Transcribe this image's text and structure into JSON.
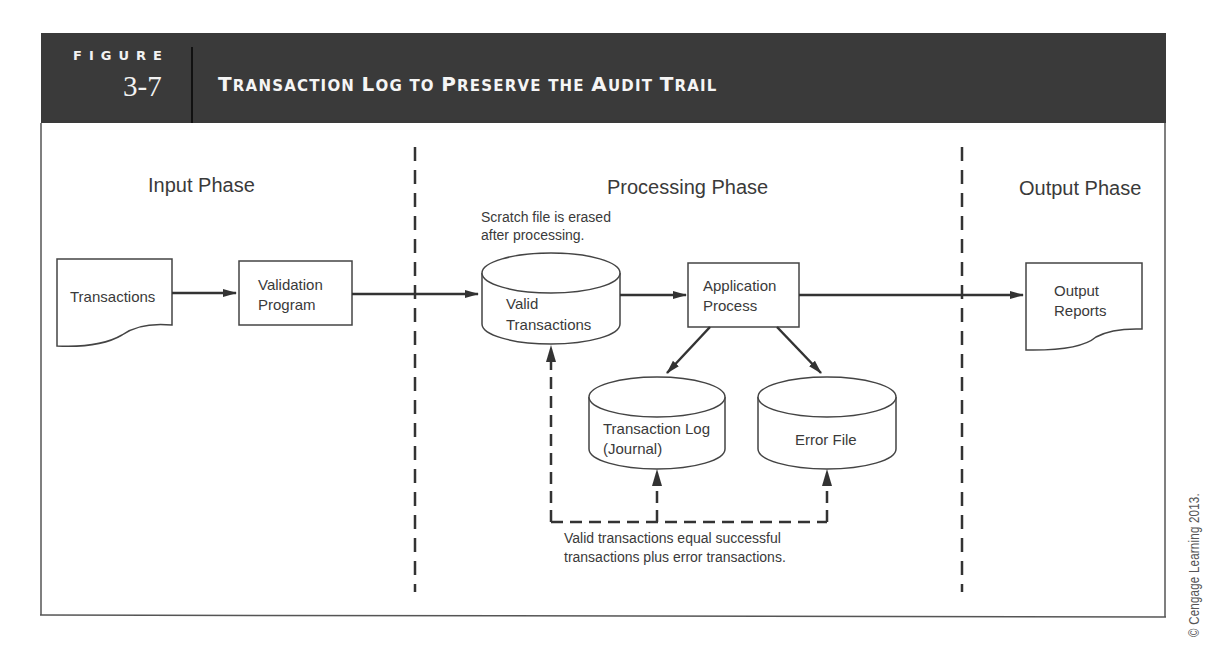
{
  "header": {
    "figure_label": "FIGURE",
    "figure_number": "3-7",
    "title_words": [
      {
        "cap": "T",
        "rest": "RANSACTION"
      },
      {
        "cap": "L",
        "rest": "OG"
      },
      {
        "cap": "",
        "rest": "TO"
      },
      {
        "cap": "P",
        "rest": "RESERVE"
      },
      {
        "cap": "",
        "rest": "THE"
      },
      {
        "cap": "A",
        "rest": "UDIT"
      },
      {
        "cap": "T",
        "rest": "RAIL"
      }
    ],
    "title": "Transaction Log to Preserve the Audit Trail"
  },
  "phases": {
    "input": "Input Phase",
    "processing": "Processing Phase",
    "output": "Output Phase"
  },
  "nodes": {
    "transactions": {
      "type": "document",
      "lines": [
        "Transactions"
      ]
    },
    "validation_program": {
      "type": "process",
      "lines": [
        "Validation",
        "Program"
      ]
    },
    "valid_transactions": {
      "type": "storage",
      "lines": [
        "Valid",
        "Transactions"
      ]
    },
    "application_process": {
      "type": "process",
      "lines": [
        "Application",
        "Process"
      ]
    },
    "output_reports": {
      "type": "document",
      "lines": [
        "Output",
        "Reports"
      ]
    },
    "transaction_log": {
      "type": "storage",
      "lines": [
        "Transaction Log",
        "(Journal)"
      ]
    },
    "error_file": {
      "type": "storage",
      "lines": [
        "Error File"
      ]
    }
  },
  "annotations": {
    "scratch_note": [
      "Scratch file is erased",
      "after processing."
    ],
    "reconcile_note": [
      "Valid transactions equal successful",
      "transactions plus error transactions."
    ]
  },
  "edges": [
    {
      "from": "transactions",
      "to": "validation_program",
      "style": "solid"
    },
    {
      "from": "validation_program",
      "to": "valid_transactions",
      "style": "solid"
    },
    {
      "from": "valid_transactions",
      "to": "application_process",
      "style": "solid"
    },
    {
      "from": "application_process",
      "to": "output_reports",
      "style": "solid"
    },
    {
      "from": "application_process",
      "to": "transaction_log",
      "style": "solid"
    },
    {
      "from": "application_process",
      "to": "error_file",
      "style": "solid"
    },
    {
      "from": "reconciliation",
      "to": "valid_transactions",
      "style": "dashed"
    },
    {
      "from": "reconciliation",
      "to": "transaction_log",
      "style": "dashed"
    },
    {
      "from": "reconciliation",
      "to": "error_file",
      "style": "dashed"
    }
  ],
  "copyright": "© Cengage Learning 2013."
}
